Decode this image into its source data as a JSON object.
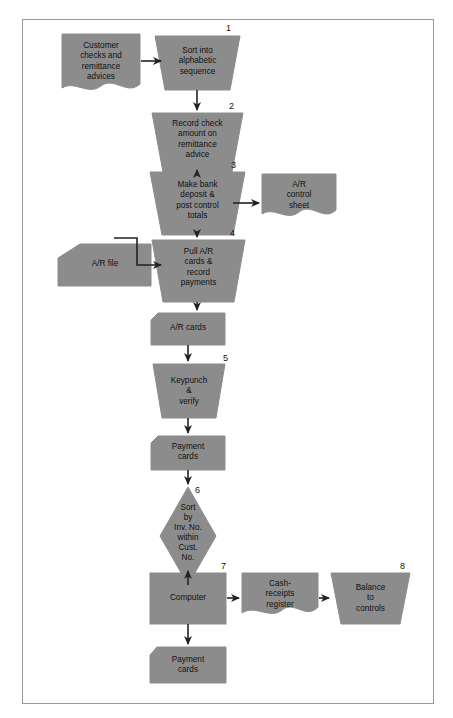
{
  "diagram": {
    "colors": {
      "shape_fill": "#8c8c8c",
      "shape_stroke": "#8c8c8c",
      "line": "#222222",
      "frame": "#9a9a9a",
      "text": "#111111",
      "background": "#ffffff"
    },
    "nodes": [
      {
        "id": "customer-checks",
        "shape": "document",
        "label": "Customer\nchecks and\nremittance\nadvices",
        "step": null
      },
      {
        "id": "sort-alphabetic",
        "shape": "manual-operation",
        "label": "Sort into\nalphabetic\nsequence",
        "step": "1"
      },
      {
        "id": "record-check-amount",
        "shape": "manual-operation",
        "label": "Record check\namount on\nremittance\nadvice",
        "step": "2"
      },
      {
        "id": "make-bank-deposit",
        "shape": "manual-operation",
        "label": "Make bank\ndeposit &\npost control\ntotals",
        "step": "3"
      },
      {
        "id": "ar-control-sheet",
        "shape": "document",
        "label": "A/R\ncontrol\nsheet",
        "step": null
      },
      {
        "id": "ar-file",
        "shape": "offline-storage",
        "label": "A/R file",
        "step": null
      },
      {
        "id": "pull-ar-cards",
        "shape": "manual-operation",
        "label": "Pull A/R\ncards &\nrecord\npayments",
        "step": "4"
      },
      {
        "id": "ar-cards",
        "shape": "punched-card",
        "label": "A/R cards",
        "step": null
      },
      {
        "id": "keypunch-verify",
        "shape": "manual-operation",
        "label": "Keypunch\n&\nverify",
        "step": "5"
      },
      {
        "id": "payment-cards-top",
        "shape": "punched-card",
        "label": "Payment\ncards",
        "step": null
      },
      {
        "id": "sort-by-invoice",
        "shape": "decision",
        "label": "Sort\nby\nInv. No.\nwithin\nCust.\nNo.",
        "step": "6"
      },
      {
        "id": "computer",
        "shape": "process",
        "label": "Computer",
        "step": "7"
      },
      {
        "id": "cash-receipts-register",
        "shape": "document",
        "label": "Cash-\nreceipts\nregister",
        "step": null
      },
      {
        "id": "balance-to-controls",
        "shape": "manual-operation",
        "label": "Balance\nto\ncontrols",
        "step": "8"
      },
      {
        "id": "payment-cards-bottom",
        "shape": "punched-card",
        "label": "Payment\ncards",
        "step": null
      }
    ],
    "step_numbers": [
      "1",
      "2",
      "3",
      "4",
      "5",
      "6",
      "7",
      "8"
    ],
    "connectors": [
      {
        "from": "customer-checks",
        "to": "sort-alphabetic",
        "direction": "right"
      },
      {
        "from": "sort-alphabetic",
        "to": "record-check-amount",
        "direction": "down"
      },
      {
        "from": "record-check-amount",
        "to": "make-bank-deposit",
        "direction": "down"
      },
      {
        "from": "make-bank-deposit",
        "to": "ar-control-sheet",
        "direction": "right"
      },
      {
        "from": "make-bank-deposit",
        "to": "pull-ar-cards",
        "direction": "down"
      },
      {
        "from": "ar-file",
        "to": "pull-ar-cards",
        "direction": "right"
      },
      {
        "from": "pull-ar-cards",
        "to": "ar-file",
        "direction": "feedback-loop"
      },
      {
        "from": "pull-ar-cards",
        "to": "ar-cards",
        "direction": "down"
      },
      {
        "from": "ar-cards",
        "to": "keypunch-verify",
        "direction": "down"
      },
      {
        "from": "keypunch-verify",
        "to": "payment-cards-top",
        "direction": "down"
      },
      {
        "from": "payment-cards-top",
        "to": "sort-by-invoice",
        "direction": "down"
      },
      {
        "from": "sort-by-invoice",
        "to": "computer",
        "direction": "down"
      },
      {
        "from": "computer",
        "to": "cash-receipts-register",
        "direction": "right"
      },
      {
        "from": "cash-receipts-register",
        "to": "balance-to-controls",
        "direction": "right"
      },
      {
        "from": "computer",
        "to": "payment-cards-bottom",
        "direction": "down"
      }
    ]
  }
}
